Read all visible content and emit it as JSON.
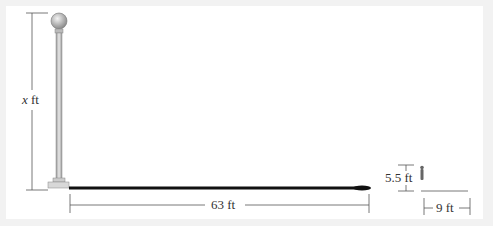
{
  "diagram": {
    "lamp_height_label_var": "x",
    "lamp_height_label_unit": "ft",
    "shadow_distance_label": "63 ft",
    "person_height_label": "5.5 ft",
    "person_shadow_label": "9 ft"
  },
  "colors": {
    "background": "#f2f2f2",
    "panel": "#ffffff",
    "lines": "#555555",
    "shadow": "#111111",
    "pole": "#c8c8c8"
  }
}
